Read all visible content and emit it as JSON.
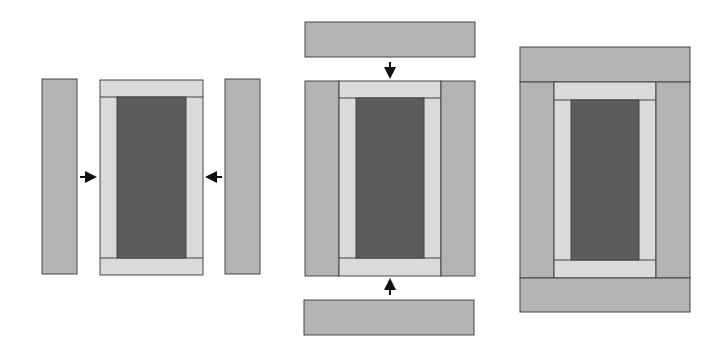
{
  "diagram": {
    "colors": {
      "center": "#5c5c5c",
      "inner_frame": "#dadada",
      "outer_strip": "#b3b3b3",
      "outline": "#444444",
      "arrow": "#111111",
      "background": "#ffffff"
    },
    "steps": [
      {
        "id": "step-1",
        "description": "Add side strips to framed center",
        "arrows": [
          "right",
          "left"
        ]
      },
      {
        "id": "step-2",
        "description": "Add top and bottom strips",
        "arrows": [
          "down",
          "up"
        ]
      },
      {
        "id": "step-3",
        "description": "Completed block"
      }
    ]
  }
}
